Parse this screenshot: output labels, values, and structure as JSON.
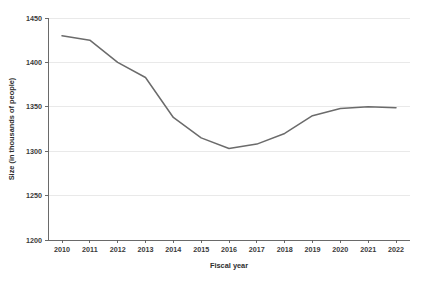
{
  "chart_data": {
    "type": "line",
    "title": "",
    "subtitle": "",
    "xlabel": "Fiscal year",
    "ylabel": "Size (in thousands of people)",
    "categories": [
      "2010",
      "2011",
      "2012",
      "2013",
      "2014",
      "2015",
      "2016",
      "2017",
      "2018",
      "2019",
      "2020",
      "2021",
      "2022"
    ],
    "x": [
      2010,
      2011,
      2012,
      2013,
      2014,
      2015,
      2016,
      2017,
      2018,
      2019,
      2020,
      2021,
      2022
    ],
    "series": [
      {
        "name": "Size",
        "values": [
          1430,
          1425,
          1400,
          1383,
          1338,
          1315,
          1303,
          1308,
          1320,
          1340,
          1348,
          1350,
          1349
        ],
        "color": "#6b6b6b"
      }
    ],
    "ylim": [
      1200,
      1450
    ],
    "yticks": [
      1200,
      1250,
      1300,
      1350,
      1400,
      1450
    ],
    "ytick_labels": [
      "1200",
      "1250",
      "1300",
      "1350",
      "1400",
      "1450"
    ],
    "xtick_labels": [
      "2010",
      "2011",
      "2012",
      "2013",
      "2014",
      "2015",
      "2016",
      "2017",
      "2018",
      "2019",
      "2020",
      "2021",
      "2022"
    ],
    "grid": true,
    "grid_axis": "y",
    "legend": false,
    "legend_position": "none",
    "annotations": []
  },
  "style": {
    "background": "#ffffff",
    "grid_color": "#e3e3e3",
    "axis_color": "#5a5a5a",
    "text_color": "#3a3a3a",
    "line_color": "#6b6b6b",
    "line_width": 1.5
  },
  "geometry": {
    "plot_left": 48,
    "plot_right": 410,
    "plot_top": 18,
    "plot_bottom": 240
  }
}
